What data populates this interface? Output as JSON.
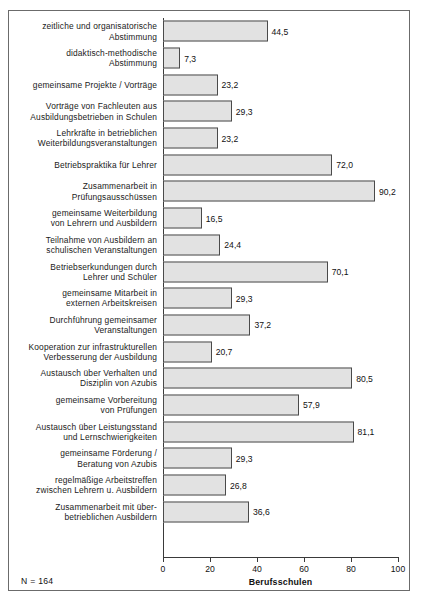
{
  "chart_data": {
    "type": "bar",
    "orientation": "horizontal",
    "title": "",
    "xlabel": "Berufsschulen",
    "ylabel": "",
    "xlim": [
      0,
      100
    ],
    "xticks": [
      0,
      20,
      40,
      60,
      80,
      100
    ],
    "xtick_labels": [
      "0",
      "20",
      "40",
      "60",
      "80",
      "100"
    ],
    "grid": false,
    "legend": false,
    "decimal_separator": ",",
    "note": "N = 164",
    "categories": [
      "zeitliche und organisatorische\nAbstimmung",
      "didaktisch-methodische\nAbstimmung",
      "gemeinsame Projekte / Vorträge",
      "Vorträge von Fachleuten aus\nAusbildungsbetrieben in Schulen",
      "Lehrkräfte in betrieblichen\nWeiterbildungsveranstaltungen",
      "Betriebspraktika für Lehrer",
      "Zusammenarbeit in\nPrüfungsausschüssen",
      "gemeinsame Weiterbildung\nvon Lehrern und Ausbildern",
      "Teilnahme von Ausbildern an\nschulischen Veranstaltungen",
      "Betriebserkundungen durch\nLehrer und Schüler",
      "gemeinsame Mitarbeit in\nexternen Arbeitskreisen",
      "Durchführung gemeinsamer\nVeranstaltungen",
      "Kooperation zur infrastrukturellen\nVerbesserung der Ausbildung",
      "Austausch über Verhalten und\nDisziplin von Azubis",
      "gemeinsame Vorbereitung\nvon Prüfungen",
      "Austausch über Leistungsstand\nund Lernschwierigkeiten",
      "gemeinsame Förderung /\nBeratung von Azubis",
      "regelmäßige Arbeitstreffen\nzwischen Lehrern u. Ausbildern",
      "Zusammenarbeit mit über-\nbetrieblichen Ausbildern"
    ],
    "values": [
      44.5,
      7.3,
      23.2,
      29.3,
      23.2,
      72.0,
      90.2,
      16.5,
      24.4,
      70.1,
      29.3,
      37.2,
      20.7,
      80.5,
      57.9,
      81.1,
      29.3,
      26.8,
      36.6
    ],
    "value_labels": [
      "44,5",
      "7,3",
      "23,2",
      "29,3",
      "23,2",
      "72,0",
      "90,2",
      "16,5",
      "24,4",
      "70,1",
      "29,3",
      "37,2",
      "20,7",
      "80,5",
      "57,9",
      "81,1",
      "29,3",
      "26,8",
      "36,6"
    ],
    "colors": {
      "bar_fill": "#e2e2e2",
      "bar_stroke": "#4a4a4a",
      "axis": "#3a3a3a",
      "text": "#1a1a1a",
      "frame": "#6b6b6b"
    }
  }
}
